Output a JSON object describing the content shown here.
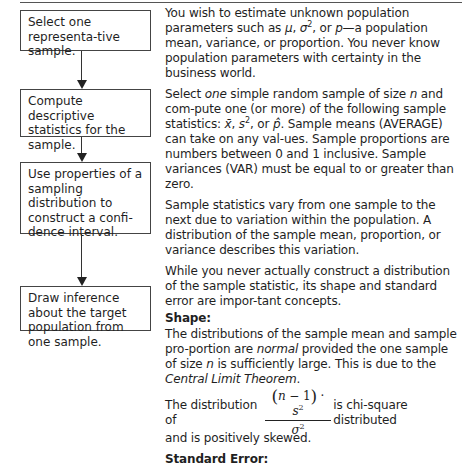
{
  "flowchart": {
    "steps": [
      {
        "label": "Select one representa-tive sample."
      },
      {
        "label": "Compute descriptive statistics for the sample."
      },
      {
        "label": "Use properties of a sampling distribution to construct a confi-dence interval."
      },
      {
        "label": "Draw inference about the target population from one sample."
      }
    ]
  },
  "text": {
    "p1": {
      "a": "You wish to estimate unknown population parameters such as ",
      "mu": "μ",
      "b": ", ",
      "sigma": "σ",
      "sup2": "2",
      "c": ", or ",
      "p": "p",
      "d": "—a population mean, variance, or proportion. You never know population parameters with certainty in the business world."
    },
    "p2": {
      "a": "Select ",
      "one": "one",
      "b": " simple random sample of size ",
      "n": "n",
      "c": " and com-pute one (or more) of the following sample statistics: ",
      "xbar": "x̄",
      "d": ", ",
      "s": "s",
      "sup2": "2",
      "e": ", or ",
      "phat": "p̂",
      "f": ". Sample means (AVERAGE) can take on any val-ues. Sample proportions are numbers between 0 and 1 inclusive. Sample variances (VAR) must be equal to or greater than zero."
    },
    "p3": "Sample statistics vary from one sample to the next due to variation within the population. A distribution of the sample mean, proportion, or variance describes this variation.",
    "p4": "While you never actually construct a distribution of the sample statistic, its shape and standard error are impor-tant concepts.",
    "shape_heading": "Shape:",
    "p5": {
      "a": "The distributions of the sample mean and sample pro-portion are ",
      "normal": "normal",
      "b": " provided the one sample of size ",
      "n": "n",
      "c": " is sufficiently large. This is due to the ",
      "clt": "Central Limit Theorem",
      "d": "."
    },
    "p6": {
      "a": "The distribution of",
      "num_open": "(",
      "num_n": "n",
      "num_mid": " − 1",
      "num_close": ")",
      "num_dot": " · ",
      "num_s": "s",
      "num_sup": "2",
      "den": "σ",
      "den_sup": "2",
      "b": "is chi-square distributed",
      "c": "and is positively skewed."
    },
    "se_heading": "Standard Error:"
  }
}
